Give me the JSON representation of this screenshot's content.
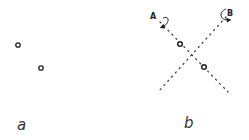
{
  "figure": {
    "panels": [
      {
        "id": "a",
        "label": "a",
        "points": 2,
        "axes": []
      },
      {
        "id": "b",
        "label": "b",
        "points": 2,
        "axes": [
          {
            "name": "A",
            "style": "dotted",
            "rotation_indicator": "curved-arrow"
          },
          {
            "name": "B",
            "style": "dotted",
            "rotation_indicator": "curved-arrow"
          }
        ]
      }
    ]
  },
  "colors": {
    "ink": "#222222",
    "background": "#ffffff"
  }
}
